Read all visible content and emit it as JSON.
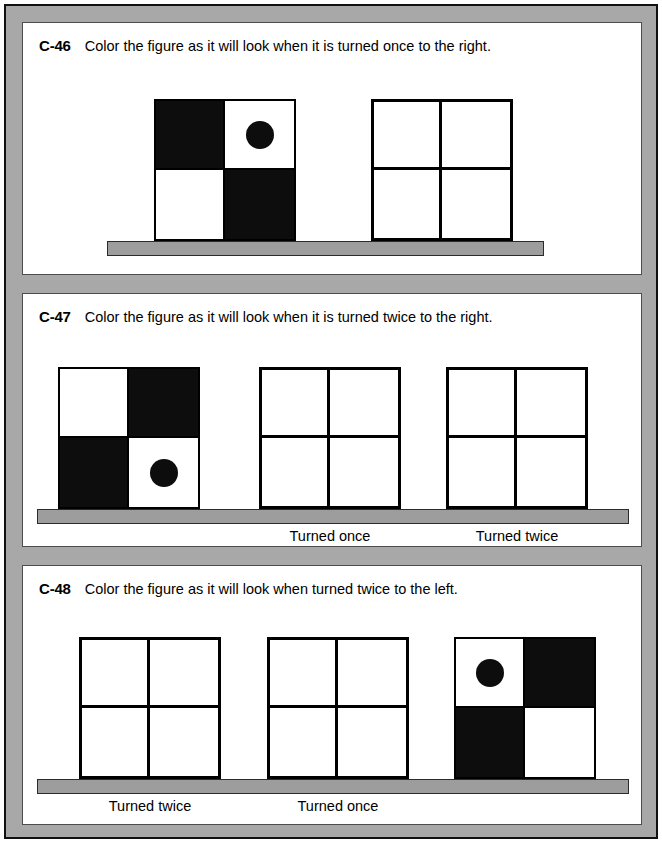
{
  "worksheet": {
    "frame_color": "#a8a8a8",
    "border_color": "#111111",
    "page_background": "#ffffff",
    "fill_color": "#0d0d0d",
    "shelf_color": "#9d9d9d"
  },
  "exercises": [
    {
      "code": "C-46",
      "prompt": "Color the figure as it will look when it is turned once to the right.",
      "figures": [
        {
          "kind": "given",
          "cells": [
            {
              "position": "top-left",
              "fill": "black",
              "dot": false
            },
            {
              "position": "top-right",
              "fill": "white",
              "dot": true
            },
            {
              "position": "bottom-left",
              "fill": "white",
              "dot": false
            },
            {
              "position": "bottom-right",
              "fill": "black",
              "dot": false
            }
          ],
          "caption": ""
        },
        {
          "kind": "blank",
          "cells": [
            {
              "position": "top-left",
              "fill": "white",
              "dot": false
            },
            {
              "position": "top-right",
              "fill": "white",
              "dot": false
            },
            {
              "position": "bottom-left",
              "fill": "white",
              "dot": false
            },
            {
              "position": "bottom-right",
              "fill": "white",
              "dot": false
            }
          ],
          "caption": ""
        }
      ]
    },
    {
      "code": "C-47",
      "prompt": "Color the figure as it will look when it is turned twice to the right.",
      "figures": [
        {
          "kind": "given",
          "cells": [
            {
              "position": "top-left",
              "fill": "white",
              "dot": false
            },
            {
              "position": "top-right",
              "fill": "black",
              "dot": false
            },
            {
              "position": "bottom-left",
              "fill": "black",
              "dot": false
            },
            {
              "position": "bottom-right",
              "fill": "white",
              "dot": true
            }
          ],
          "caption": ""
        },
        {
          "kind": "blank",
          "cells": [
            {
              "position": "top-left",
              "fill": "white",
              "dot": false
            },
            {
              "position": "top-right",
              "fill": "white",
              "dot": false
            },
            {
              "position": "bottom-left",
              "fill": "white",
              "dot": false
            },
            {
              "position": "bottom-right",
              "fill": "white",
              "dot": false
            }
          ],
          "caption": "Turned once"
        },
        {
          "kind": "blank",
          "cells": [
            {
              "position": "top-left",
              "fill": "white",
              "dot": false
            },
            {
              "position": "top-right",
              "fill": "white",
              "dot": false
            },
            {
              "position": "bottom-left",
              "fill": "white",
              "dot": false
            },
            {
              "position": "bottom-right",
              "fill": "white",
              "dot": false
            }
          ],
          "caption": "Turned twice"
        }
      ]
    },
    {
      "code": "C-48",
      "prompt": "Color the figure as it will look when turned twice to the left.",
      "figures": [
        {
          "kind": "blank",
          "cells": [
            {
              "position": "top-left",
              "fill": "white",
              "dot": false
            },
            {
              "position": "top-right",
              "fill": "white",
              "dot": false
            },
            {
              "position": "bottom-left",
              "fill": "white",
              "dot": false
            },
            {
              "position": "bottom-right",
              "fill": "white",
              "dot": false
            }
          ],
          "caption": "Turned twice"
        },
        {
          "kind": "blank",
          "cells": [
            {
              "position": "top-left",
              "fill": "white",
              "dot": false
            },
            {
              "position": "top-right",
              "fill": "white",
              "dot": false
            },
            {
              "position": "bottom-left",
              "fill": "white",
              "dot": false
            },
            {
              "position": "bottom-right",
              "fill": "white",
              "dot": false
            }
          ],
          "caption": "Turned once"
        },
        {
          "kind": "given",
          "cells": [
            {
              "position": "top-left",
              "fill": "white",
              "dot": true
            },
            {
              "position": "top-right",
              "fill": "black",
              "dot": false
            },
            {
              "position": "bottom-left",
              "fill": "black",
              "dot": false
            },
            {
              "position": "bottom-right",
              "fill": "white",
              "dot": false
            }
          ],
          "caption": ""
        }
      ]
    }
  ]
}
